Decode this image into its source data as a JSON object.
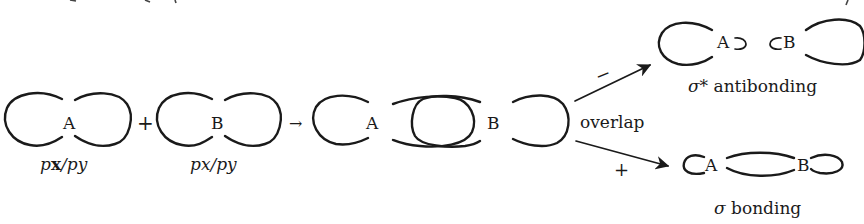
{
  "figure": {
    "type": "orbital-overlap-diagram",
    "colors": {
      "ink": "#1a1a1a",
      "background": "#ffffff"
    }
  },
  "orbitals": [
    {
      "id": "orbital-a",
      "atom": "A",
      "label_parts": [
        "p",
        "x",
        "/",
        "p",
        "y"
      ],
      "label": "px/py"
    },
    {
      "id": "orbital-b",
      "atom": "B",
      "label_parts": [
        "p",
        "x",
        "/",
        "p",
        "y"
      ],
      "label": "px/py"
    }
  ],
  "operators": {
    "plus": "+",
    "arrow": "→"
  },
  "overlap_stage": {
    "atom_a": "A",
    "atom_b": "B",
    "label": "overlap"
  },
  "branches": {
    "antibonding": {
      "sign": "−",
      "atom_a": "A",
      "atom_b": "B",
      "sigma": "σ*",
      "label": "antibonding"
    },
    "bonding": {
      "sign": "+",
      "atom_a": "A",
      "atom_b": "B",
      "sigma": "σ",
      "label": "bonding"
    }
  }
}
